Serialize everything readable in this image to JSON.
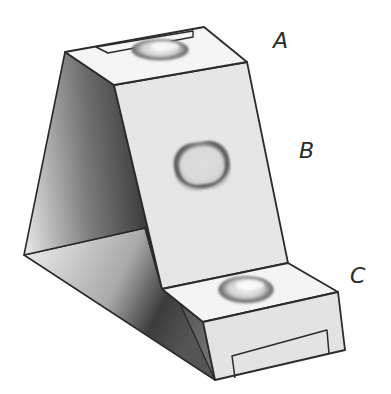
{
  "figure": {
    "labels": [
      {
        "id": "A",
        "text": "A",
        "x": 273,
        "y": 30
      },
      {
        "id": "B",
        "text": "B",
        "x": 299,
        "y": 140
      },
      {
        "id": "C",
        "text": "C",
        "x": 350,
        "y": 265
      }
    ],
    "colors": {
      "outline": "#2b2b2b",
      "light_face": "#e9e9e9",
      "top_face": "#f4f4f4",
      "shadow_dark": "#3a3a3a",
      "shadow_light": "#f0f0f0",
      "blob": "#bdbdbd"
    }
  }
}
